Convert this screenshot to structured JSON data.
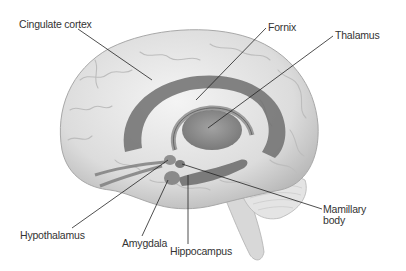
{
  "diagram": {
    "colors": {
      "background": "#ffffff",
      "brain_light": "#e6e6e6",
      "brain_mid": "#c8c8c8",
      "limbic_dark": "#6e6e6e",
      "label_text": "#333333",
      "leader_line": "#222222"
    },
    "labels": [
      {
        "id": "cingulate-cortex",
        "text": "Cingulate cortex",
        "x": 19,
        "y": 19
      },
      {
        "id": "fornix",
        "text": "Fornix",
        "x": 268,
        "y": 22
      },
      {
        "id": "thalamus",
        "text": "Thalamus",
        "x": 335,
        "y": 30
      },
      {
        "id": "hypothalamus",
        "text": "Hypothalamus",
        "x": 20,
        "y": 230
      },
      {
        "id": "amygdala",
        "text": "Amygdala",
        "x": 122,
        "y": 238
      },
      {
        "id": "hippocampus",
        "text": "Hippocampus",
        "x": 170,
        "y": 246
      },
      {
        "id": "mamillary-body",
        "text": "Mamillary\nbody",
        "x": 323,
        "y": 204
      }
    ]
  }
}
